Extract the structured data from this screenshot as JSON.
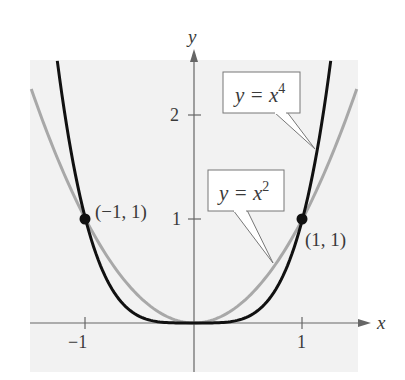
{
  "chart_data": {
    "type": "line",
    "title": "",
    "xlabel": "x",
    "ylabel": "y",
    "xlim": [
      -1.5,
      1.6
    ],
    "ylim": [
      -0.45,
      2.6
    ],
    "x_ticks": [
      {
        "value": -1,
        "label": "−1"
      },
      {
        "value": 1,
        "label": "1"
      }
    ],
    "y_ticks": [
      {
        "value": 1,
        "label": "1"
      },
      {
        "value": 2,
        "label": "2"
      }
    ],
    "grid": false,
    "series": [
      {
        "name": "y = x^2",
        "label_text": "y = x",
        "exponent_text": "2",
        "exponent": 2,
        "color": "#a8a8a8",
        "x_range": [
          -1.5,
          1.5
        ]
      },
      {
        "name": "y = x^4",
        "label_text": "y = x",
        "exponent_text": "4",
        "exponent": 4,
        "color": "#111111",
        "x_range": [
          -1.26,
          1.26
        ]
      }
    ],
    "points": [
      {
        "x": -1,
        "y": 1,
        "label": "(−1, 1)"
      },
      {
        "x": 1,
        "y": 1,
        "label": "(1, 1)"
      }
    ],
    "background_color": "#f2f2f2"
  },
  "labels": {
    "x_axis": "x",
    "y_axis": "y",
    "tick_neg1": "−1",
    "tick_x1": "1",
    "tick_y1": "1",
    "tick_y2": "2",
    "point_left": "(−1, 1)",
    "point_right": "(1, 1)",
    "callout_x4_base": "y = x",
    "callout_x4_exp": "4",
    "callout_x2_base": "y = x",
    "callout_x2_exp": "2"
  }
}
